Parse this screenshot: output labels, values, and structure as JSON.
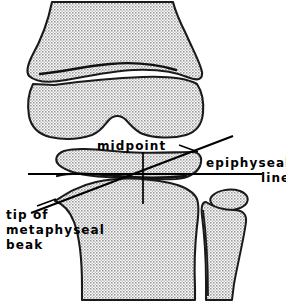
{
  "figure": {
    "name": "knee-epiphyseal-line-diagram",
    "type": "anatomical-line-drawing",
    "background_color": "#ffffff",
    "ink_color": "#000000",
    "fill_pattern": "stipple-halftone-gray",
    "fill_color": "#b4b4b4"
  },
  "labels": {
    "midpoint": "midpoint",
    "epiphyseal_line_1": "epiphyseal",
    "epiphyseal_line_2": "line",
    "beak_1": "tip of",
    "beak_2": "metaphyseal",
    "beak_3": "beak"
  },
  "annotations": {
    "epiphyseal_line": {
      "name": "epiphyseal-line",
      "orientation": "horizontal",
      "x1": 28,
      "y1": 174,
      "x2": 262,
      "y2": 174
    },
    "metaphyseal_beak_line": {
      "name": "metaphyseal-beak-line",
      "orientation": "oblique",
      "x1": 31,
      "y1": 213,
      "x2": 233,
      "y2": 136
    },
    "midpoint_marker": {
      "name": "midpoint-vertical-marker",
      "orientation": "vertical",
      "x1": 143,
      "y1": 152,
      "x2": 143,
      "y2": 204
    },
    "midpoint_leader": {
      "name": "midpoint-leader-line",
      "x1": 178,
      "y1": 146,
      "x2": 196,
      "y2": 152
    },
    "beak_leader": {
      "name": "beak-leader-line",
      "x1": 37,
      "y1": 207,
      "x2": 55,
      "y2": 200
    }
  },
  "bones": [
    {
      "name": "femoral-shaft-metaphysis",
      "label": "distal femur metaphysis"
    },
    {
      "name": "femoral-epiphysis-condyles",
      "label": "distal femoral epiphysis"
    },
    {
      "name": "tibial-epiphysis",
      "label": "proximal tibial epiphysis"
    },
    {
      "name": "tibial-metaphysis-shaft",
      "label": "proximal tibial metaphysis"
    },
    {
      "name": "fibular-head",
      "label": "fibular head"
    },
    {
      "name": "fibular-epiphysis",
      "label": "fibular head epiphysis"
    }
  ]
}
